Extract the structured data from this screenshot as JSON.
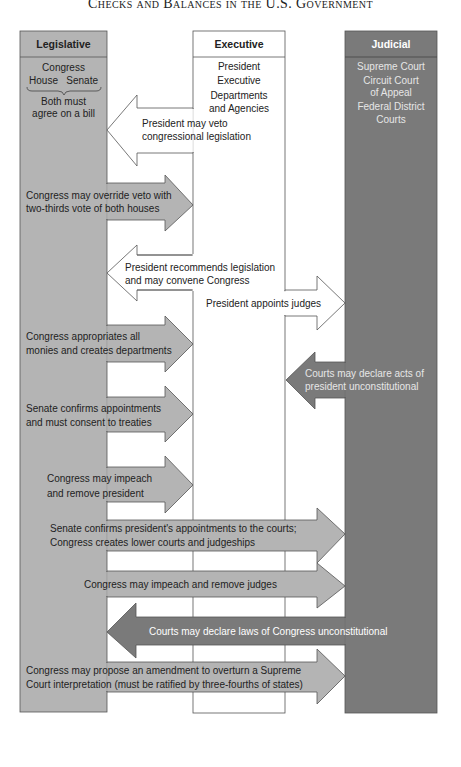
{
  "title": "Checks and Balances in the U.S. Government",
  "colors": {
    "legislative": "#b4b4b4",
    "executive": "#ffffff",
    "judicial": "#7a7a7a",
    "outline": "#555555",
    "legislative_arrow": "#b4b4b4",
    "judicial_arrow": "#7a7a7a"
  },
  "branches": {
    "legislative": {
      "header": "Legislative",
      "lines": [
        "Congress",
        "House   Senate",
        "Both must",
        "agree on a bill"
      ]
    },
    "executive": {
      "header": "Executive",
      "lines": [
        "President",
        "Executive",
        "Departments",
        "and Agencies"
      ]
    },
    "judicial": {
      "header": "Judicial",
      "lines": [
        "Supreme Court",
        "Circuit Court",
        "of Appeal",
        "Federal District",
        "Courts"
      ]
    }
  },
  "arrows": [
    {
      "from": "Executive",
      "to": "Legislative",
      "lines": [
        "President may veto",
        "congressional legislation"
      ]
    },
    {
      "from": "Legislative",
      "to": "Executive",
      "lines": [
        "Congress may override veto with",
        "two-thirds vote of both houses"
      ]
    },
    {
      "from": "Executive",
      "to": "Legislative",
      "lines": [
        "President recommends legislation",
        "and may convene Congress"
      ]
    },
    {
      "from": "Executive",
      "to": "Judicial",
      "lines": [
        "President appoints judges"
      ]
    },
    {
      "from": "Legislative",
      "to": "Executive",
      "lines": [
        "Congress appropriates all",
        "monies and creates departments"
      ]
    },
    {
      "from": "Judicial",
      "to": "Executive",
      "lines": [
        "Courts may declare acts of",
        "president unconstitutional"
      ]
    },
    {
      "from": "Legislative",
      "to": "Executive",
      "lines": [
        "Senate confirms appointments",
        "and must consent to treaties"
      ]
    },
    {
      "from": "Legislative",
      "to": "Executive",
      "lines": [
        "Congress may impeach",
        "and remove president"
      ]
    },
    {
      "from": "Legislative",
      "to": "Judicial",
      "lines": [
        "Senate confirms president's appointments to the courts;",
        "Congress creates lower courts and judgeships"
      ]
    },
    {
      "from": "Legislative",
      "to": "Judicial",
      "lines": [
        "Congress may impeach and remove judges"
      ]
    },
    {
      "from": "Judicial",
      "to": "Legislative",
      "lines": [
        "Courts may declare laws of Congress unconstitutional"
      ]
    },
    {
      "from": "Legislative",
      "to": "Judicial",
      "lines": [
        "Congress may propose an amendment to overturn a Supreme",
        "Court interpretation (must be ratified by three-fourths of states)"
      ]
    }
  ]
}
